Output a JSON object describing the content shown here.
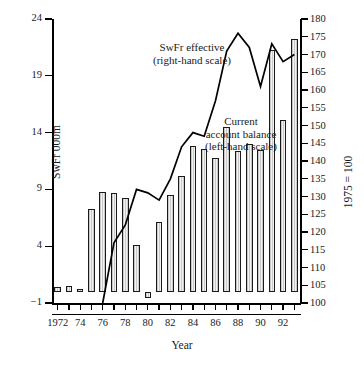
{
  "chart_data": {
    "type": "bar",
    "title": "",
    "xlabel": "Year",
    "ylabel": "SwFr 000m",
    "ylabel_right": "1975 = 100",
    "x": [
      1972,
      1973,
      1974,
      1975,
      1976,
      1977,
      1978,
      1979,
      1980,
      1981,
      1982,
      1983,
      1984,
      1985,
      1986,
      1987,
      1988,
      1989,
      1990,
      1991,
      1992,
      1993
    ],
    "xtick_labels": [
      "1972",
      "74",
      "76",
      "78",
      "80",
      "82",
      "84",
      "86",
      "88",
      "90",
      "92"
    ],
    "xtick_values": [
      1972,
      1974,
      1976,
      1978,
      1980,
      1982,
      1984,
      1986,
      1988,
      1990,
      1992
    ],
    "ylim": [
      -1,
      24
    ],
    "ytick_values": [
      -1,
      4,
      9,
      14,
      19,
      24
    ],
    "ytick_labels": [
      "−1",
      "4",
      "9",
      "14",
      "19",
      "24"
    ],
    "ylim_right": [
      100,
      180
    ],
    "ytick_values_right": [
      100,
      105,
      110,
      115,
      120,
      125,
      130,
      135,
      140,
      145,
      150,
      155,
      160,
      165,
      170,
      175,
      180
    ],
    "ytick_labels_right": [
      "100",
      "105",
      "110",
      "115",
      "120",
      "125",
      "130",
      "135",
      "140",
      "145",
      "150",
      "155",
      "160",
      "165",
      "170",
      "175",
      "180"
    ],
    "grid": false,
    "legend_position": "inline-annotations",
    "series": [
      {
        "name": "Current account balance",
        "type": "bar",
        "axis": "left",
        "units": "SwFr 000m",
        "annotation": "Current account balance (left-hand scale)",
        "values": [
          0.4,
          0.5,
          0.2,
          7.3,
          8.8,
          8.7,
          8.2,
          4.1,
          -0.6,
          6.1,
          8.5,
          10.2,
          12.8,
          12.6,
          11.8,
          14.5,
          12.4,
          13.0,
          12.5,
          21.3,
          15.1,
          22.2
        ]
      },
      {
        "name": "SwFr effective",
        "type": "line",
        "axis": "right",
        "units": "1975 = 100",
        "annotation": "SwFr effective (right-hand scale)",
        "x": [
          1976,
          1977,
          1978,
          1979,
          1980,
          1981,
          1982,
          1983,
          1984,
          1985,
          1986,
          1987,
          1988,
          1989,
          1990,
          1991,
          1992,
          1993
        ],
        "values": [
          100,
          117,
          122,
          132,
          131,
          129,
          135,
          144,
          148,
          147,
          157,
          171,
          176,
          172,
          161,
          173,
          168,
          170
        ]
      }
    ],
    "annotations": [
      {
        "id": "swfr-effective-label",
        "line1": "SwFr effective",
        "line2": "(right-hand scale)"
      },
      {
        "id": "current-account-label",
        "line1": "Current",
        "line2": "account balance",
        "line3": "(left-hand scale)"
      }
    ]
  }
}
